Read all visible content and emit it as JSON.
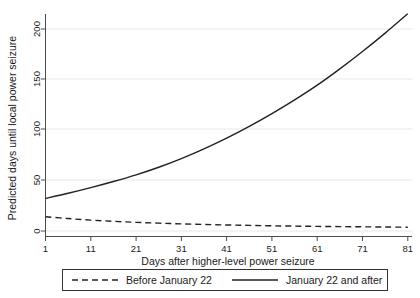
{
  "chart_data": {
    "type": "line",
    "title": "",
    "xlabel": "Days after higher-level power seizure",
    "ylabel": "Predicted days until local power seizure",
    "xlim": [
      1,
      81
    ],
    "ylim": [
      0,
      215
    ],
    "xticks": [
      1,
      11,
      21,
      31,
      41,
      51,
      61,
      71,
      81
    ],
    "yticks": [
      0,
      50,
      100,
      150,
      200
    ],
    "grid": "horizontal",
    "legend_position": "bottom",
    "x": [
      1,
      6,
      11,
      16,
      21,
      26,
      31,
      36,
      41,
      46,
      51,
      56,
      61,
      66,
      71,
      76,
      81
    ],
    "series": [
      {
        "name": "Before January 22",
        "style": "dashed",
        "color": "#222222",
        "values": [
          14.0,
          12.2,
          10.7,
          9.5,
          8.5,
          7.7,
          7.0,
          6.4,
          5.9,
          5.5,
          5.1,
          4.8,
          4.5,
          4.3,
          4.1,
          3.9,
          3.7
        ]
      },
      {
        "name": "January 22 and after",
        "style": "solid",
        "color": "#222222",
        "values": [
          32.0,
          37.0,
          42.5,
          48.5,
          55.0,
          62.5,
          71.0,
          80.5,
          91.0,
          102.5,
          115.0,
          128.5,
          143.0,
          159.0,
          176.0,
          194.0,
          213.0
        ]
      }
    ]
  },
  "axis": {
    "y_title": "Predicted days until local power seizure",
    "x_title": "Days after higher-level power seizure",
    "y_tick_labels": [
      "0",
      "50",
      "100",
      "150",
      "200"
    ],
    "x_tick_labels": [
      "1",
      "11",
      "21",
      "31",
      "41",
      "51",
      "61",
      "71",
      "81"
    ]
  },
  "legend": {
    "entries": [
      {
        "label": "Before January 22",
        "style": "dashed"
      },
      {
        "label": "January 22 and after",
        "style": "solid"
      }
    ]
  },
  "colors": {
    "line": "#222222",
    "grid": "#e8e8e8",
    "axis": "#4d4d4d",
    "background": "#ffffff"
  }
}
